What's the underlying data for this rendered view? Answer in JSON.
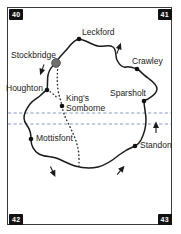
{
  "map": {
    "title": "Test Valley area road map",
    "colors": {
      "frame": "#3a3a3a",
      "route": "#1b1b1b",
      "dotted_route": "#2b2b2b",
      "boundary_dashed": "#7a8fb5",
      "marker": "#111111",
      "label_text": "#1b1b1b",
      "grid_label_bg": "#111111",
      "grid_label_text": "#ffffff",
      "background": "#ffffff"
    },
    "grid_labels": {
      "top_left": "40",
      "top_right": "41",
      "bottom_left": "42",
      "bottom_right": "43"
    },
    "places": [
      {
        "name": "Leckford",
        "label": "Leckford",
        "marker": "dot",
        "x": 79,
        "y": 39,
        "label_x": 82,
        "label_y": 28
      },
      {
        "name": "Stockbridge",
        "label": "Stockbridge",
        "marker": "town",
        "x": 56,
        "y": 63,
        "label_x": 12,
        "label_y": 52
      },
      {
        "name": "Crawley",
        "label": "Crawley",
        "marker": "dot",
        "x": 137,
        "y": 69,
        "label_x": 134,
        "label_y": 58
      },
      {
        "name": "Houghton",
        "label": "Houghton",
        "marker": "dot",
        "x": 47,
        "y": 90,
        "label_x": 7,
        "label_y": 85
      },
      {
        "name": "Sparsholt",
        "label": "Sparsholt",
        "marker": "dot",
        "x": 144,
        "y": 101,
        "label_x": 110,
        "label_y": 90
      },
      {
        "name": "King's Somborne",
        "label": "King's Somborne",
        "marker": "dot",
        "x": 62,
        "y": 106,
        "label_x": 66,
        "label_y": 95
      },
      {
        "name": "Mottisfont",
        "label": "Mottisfont",
        "marker": "dot",
        "x": 31,
        "y": 139,
        "label_x": 35,
        "label_y": 134
      },
      {
        "name": "Standon",
        "label": "Standon",
        "marker": "dot",
        "x": 135,
        "y": 146,
        "label_x": 140,
        "label_y": 141
      }
    ],
    "boundary_lines": [
      {
        "name": "boundary-dashed-upper",
        "y": 113
      },
      {
        "name": "boundary-dashed-lower",
        "y": 124
      }
    ],
    "direction_arrows": [
      {
        "name": "arrow-stockbridge-west",
        "x": 42,
        "y": 70,
        "rotation": 200
      },
      {
        "name": "arrow-leckford-north",
        "x": 119,
        "y": 48,
        "rotation": 20
      },
      {
        "name": "arrow-sparsholt-east",
        "x": 156,
        "y": 127,
        "rotation": 0
      },
      {
        "name": "arrow-south-west",
        "x": 53,
        "y": 172,
        "rotation": 155
      },
      {
        "name": "arrow-south-east",
        "x": 121,
        "y": 170,
        "rotation": 40
      }
    ]
  }
}
